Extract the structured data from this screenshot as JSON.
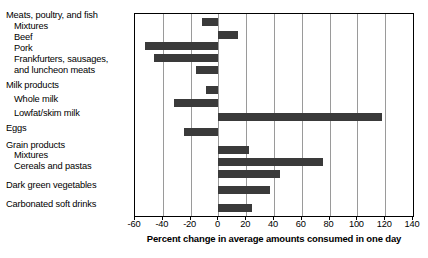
{
  "chart_data": {
    "type": "bar",
    "orientation": "horizontal",
    "title": "",
    "xlabel": "Percent change in average amounts consumed in one day",
    "ylabel": "",
    "xlim": [
      -60,
      140
    ],
    "xticks": [
      -60,
      -40,
      -20,
      0,
      20,
      40,
      60,
      80,
      100,
      120,
      140
    ],
    "xticklabels": [
      "-60",
      "-40",
      "-20",
      "0",
      "20",
      "40",
      "60",
      "80",
      "100",
      "120",
      "140"
    ],
    "grid": "vertical",
    "legend": "none",
    "bar_color": "#3a3a3a",
    "categories": [
      "Meats, poultry, and fish",
      "Mixtures",
      "Beef",
      "Pork",
      "Frankfurters, sausages, and luncheon meats",
      "Milk products",
      "Whole milk",
      "Lowfat/skim milk",
      "Eggs",
      "Grain products",
      "Mixtures",
      "Cereals and pastas",
      "Dark green vegetables",
      "Carbonated soft drinks"
    ],
    "values": [
      -12,
      14,
      -53,
      -46,
      -16,
      -9,
      -32,
      118,
      -25,
      22,
      75,
      44,
      37,
      24
    ]
  },
  "labels": [
    {
      "text": "Meats, poultry, and fish",
      "indent": 0,
      "top": 10
    },
    {
      "text": "Mixtures",
      "indent": 1,
      "top": 21
    },
    {
      "text": "Beef",
      "indent": 1,
      "top": 32
    },
    {
      "text": "Pork",
      "indent": 1,
      "top": 43
    },
    {
      "text": "Frankfurters, sausages,",
      "indent": 1,
      "top": 54
    },
    {
      "text": "and luncheon meats",
      "indent": 1,
      "top": 65
    },
    {
      "text": "Milk products",
      "indent": 0,
      "top": 80
    },
    {
      "text": "Whole milk",
      "indent": 1,
      "top": 94
    },
    {
      "text": "Lowfat/skim milk",
      "indent": 1,
      "top": 108
    },
    {
      "text": "Eggs",
      "indent": 0,
      "top": 123
    },
    {
      "text": "Grain products",
      "indent": 0,
      "top": 140
    },
    {
      "text": "Mixtures",
      "indent": 1,
      "top": 150
    },
    {
      "text": "Cereals and pastas",
      "indent": 1,
      "top": 161
    },
    {
      "text": "Dark green vegetables",
      "indent": 0,
      "top": 180
    },
    {
      "text": "Carbonated soft drinks",
      "indent": 0,
      "top": 199
    }
  ],
  "bar_rows": [
    {
      "name": "meats-poultry-and-fish",
      "value": -12,
      "top": 4
    },
    {
      "name": "meats-mixtures",
      "value": 14,
      "top": 17
    },
    {
      "name": "beef",
      "value": -53,
      "top": 28
    },
    {
      "name": "pork",
      "value": -46,
      "top": 40
    },
    {
      "name": "frankfurters",
      "value": -16,
      "top": 52
    },
    {
      "name": "milk-products",
      "value": -9,
      "top": 72
    },
    {
      "name": "whole-milk",
      "value": -32,
      "top": 85
    },
    {
      "name": "lowfat-skim-milk",
      "value": 118,
      "top": 99
    },
    {
      "name": "eggs",
      "value": -25,
      "top": 114
    },
    {
      "name": "grain-products",
      "value": 22,
      "top": 132
    },
    {
      "name": "grain-mixtures",
      "value": 75,
      "top": 144
    },
    {
      "name": "cereals-and-pastas",
      "value": 44,
      "top": 156
    },
    {
      "name": "dark-green-vegetables",
      "value": 37,
      "top": 172
    },
    {
      "name": "carbonated-soft-drinks",
      "value": 24,
      "top": 190
    }
  ]
}
